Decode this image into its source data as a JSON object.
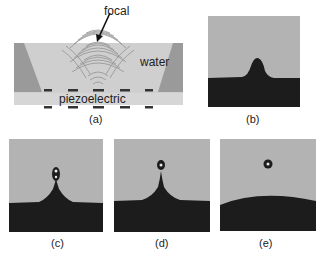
{
  "figure": {
    "panels": [
      {
        "id": "a",
        "caption": "(a)",
        "annotations": {
          "focal": "focal",
          "water": "water",
          "piezoelectric": "piezoelectric"
        }
      },
      {
        "id": "b",
        "caption": "(b)"
      },
      {
        "id": "c",
        "caption": "(c)"
      },
      {
        "id": "d",
        "caption": "(d)"
      },
      {
        "id": "e",
        "caption": "(e)"
      }
    ],
    "colors": {
      "water": "#cfcfcf",
      "wall": "#9a9a9a",
      "piezo": "#d6d6d6",
      "electrode": "#333333",
      "photo_background": "#b3b3b3",
      "liquid": "#1c1c1c"
    }
  }
}
